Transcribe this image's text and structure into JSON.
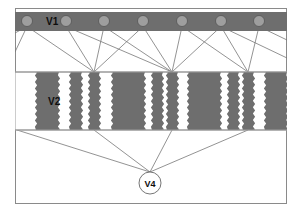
{
  "figure": {
    "title": "",
    "type": "neural-hierarchy-diagram",
    "canvas": {
      "width": 300,
      "height": 212
    },
    "frame": {
      "x": 15,
      "y": 8,
      "width": 272,
      "height": 196,
      "stroke": "#808080",
      "fill": "#ffffff"
    }
  },
  "colors": {
    "band_gray": "#6e6e6e",
    "stripe_gray": "#6e6e6e",
    "circle_fill": "#9e9e9e",
    "circle_stroke": "#555555",
    "line": "#777777",
    "frame_stroke": "#8a8a8a",
    "label_text": "#111111",
    "background": "#ffffff"
  },
  "layers": {
    "v1": {
      "label": "V1",
      "label_x": 46,
      "label_y": 22,
      "band": {
        "x": 15,
        "y": 12,
        "width": 272,
        "height": 19
      },
      "node_radius": 5.5,
      "node_cy": 21,
      "nodes_cx": [
        27,
        66,
        104,
        143,
        182,
        221,
        259
      ]
    },
    "v2": {
      "label": "V2",
      "label_x": 48,
      "label_y": 102,
      "band": {
        "x": 15,
        "y": 72,
        "width": 272,
        "height": 58
      },
      "stripes": [
        {
          "x": 36,
          "width": 23,
          "serrated": true
        },
        {
          "x": 70,
          "width": 12,
          "serrated": true
        },
        {
          "x": 89,
          "width": 11,
          "serrated": true
        },
        {
          "x": 112,
          "width": 33,
          "serrated": true
        },
        {
          "x": 152,
          "width": 11,
          "serrated": true
        },
        {
          "x": 167,
          "width": 11,
          "serrated": true
        },
        {
          "x": 188,
          "width": 33,
          "serrated": true
        },
        {
          "x": 228,
          "width": 11,
          "serrated": true
        },
        {
          "x": 243,
          "width": 11,
          "serrated": true
        },
        {
          "x": 265,
          "width": 22,
          "serrated": true
        }
      ]
    },
    "v4": {
      "label": "V4",
      "node": {
        "cx": 150,
        "cy": 183,
        "r": 11
      }
    }
  },
  "connections": {
    "v1_to_v2_targets": [
      94,
      172,
      248
    ],
    "v1_to_v2_edges": [
      {
        "from_cx": 27,
        "to_x": 94
      },
      {
        "from_cx": 66,
        "to_x": 94
      },
      {
        "from_cx": 104,
        "to_x": 94
      },
      {
        "from_cx": 143,
        "to_x": 94
      },
      {
        "from_cx": 66,
        "to_x": 172
      },
      {
        "from_cx": 104,
        "to_x": 172
      },
      {
        "from_cx": 143,
        "to_x": 172
      },
      {
        "from_cx": 182,
        "to_x": 172
      },
      {
        "from_cx": 221,
        "to_x": 172
      },
      {
        "from_cx": 182,
        "to_x": 248
      },
      {
        "from_cx": 221,
        "to_x": 248
      },
      {
        "from_cx": 259,
        "to_x": 248
      }
    ],
    "v1_offscreen_edges": [
      {
        "from_cx": 27,
        "to_x": 15,
        "to_y": 52
      },
      {
        "from_cx": 27,
        "to_x": 15,
        "to_y": 33
      },
      {
        "from_cx": 259,
        "to_x": 287,
        "to_y": 40
      },
      {
        "from_cx": 221,
        "to_x": 287,
        "to_y": 58
      }
    ],
    "v2_to_v4_sources": [
      17,
      94,
      172,
      248
    ],
    "v2_band_bottom_y": 130
  }
}
